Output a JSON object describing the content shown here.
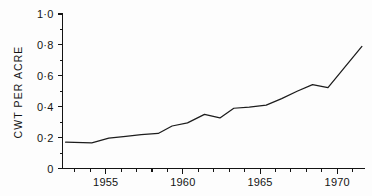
{
  "chart_data": {
    "type": "line",
    "title": "",
    "xlabel": "",
    "ylabel": "CWT PER ACRE",
    "xlim": [
      1952.2,
      1971.8
    ],
    "ylim": [
      0,
      1.0
    ],
    "grid": false,
    "legend": "none",
    "x_tick_labels": [
      "1955",
      "1960",
      "1965",
      "1970"
    ],
    "x_tick_values": [
      1955,
      1960,
      1965,
      1970
    ],
    "x_minor_tick_values": [
      1953,
      1954,
      1956,
      1957,
      1958,
      1959,
      1961,
      1962,
      1963,
      1964,
      1966,
      1967,
      1968,
      1969,
      1971
    ],
    "y_tick_labels": [
      "1·0",
      "0·8",
      "0·6",
      "0·4",
      "0·2",
      "0"
    ],
    "y_tick_values": [
      1.0,
      0.8,
      0.6,
      0.4,
      0.2,
      0
    ],
    "y_minor_tick_values": [
      0.9,
      0.7,
      0.5,
      0.3,
      0.1
    ],
    "series": [
      {
        "name": "CWT per acre",
        "color": "#1c1c1c",
        "x": [
          1952.4,
          1954.1,
          1955.2,
          1956.3,
          1957.3,
          1958.4,
          1959.3,
          1960.3,
          1961.4,
          1962.4,
          1963.3,
          1964.3,
          1965.4,
          1966.4,
          1967.4,
          1968.4,
          1969.4,
          1970.4,
          1971.6
        ],
        "y": [
          0.17,
          0.166,
          0.196,
          0.208,
          0.219,
          0.227,
          0.275,
          0.295,
          0.35,
          0.327,
          0.39,
          0.398,
          0.41,
          0.452,
          0.5,
          0.543,
          0.523,
          0.645,
          0.79
        ]
      }
    ]
  },
  "axes": {
    "y_axis_label": "CWT PER ACRE"
  }
}
